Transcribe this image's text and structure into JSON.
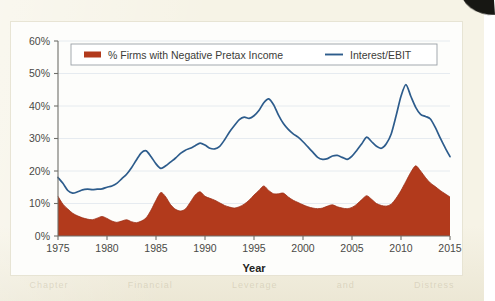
{
  "figure": {
    "type": "scanned-chart-figure",
    "background_color": "#f6f3e6",
    "card_color": "#fdfdfb"
  },
  "legend": {
    "position": "top-inside",
    "entries": [
      {
        "label": "% Firms with Negative Pretax Income",
        "marker": "filled-swatch",
        "color": "#b23a1c"
      },
      {
        "label": "Interest/EBIT",
        "marker": "line",
        "color": "#2d5c8c"
      }
    ]
  },
  "axes": {
    "x": {
      "title": "Year",
      "ticks": [
        "1975",
        "1980",
        "1985",
        "1990",
        "1995",
        "2000",
        "2005",
        "2010",
        "2015"
      ],
      "min": 1975,
      "max": 2015
    },
    "y": {
      "title": "",
      "ticks": [
        "0%",
        "10%",
        "20%",
        "30%",
        "40%",
        "50%",
        "60%"
      ],
      "min": 0,
      "max": 60,
      "unit": "%"
    }
  },
  "chart_data": {
    "type": "area",
    "title": "",
    "subtitle": "",
    "xlabel": "Year",
    "ylabel": "",
    "xlim": [
      1975,
      2015
    ],
    "ylim": [
      0,
      60
    ],
    "grid": true,
    "legend_position": "top-inside",
    "x_tick_labels": [
      "1975",
      "1980",
      "1985",
      "1990",
      "1995",
      "2000",
      "2005",
      "2010",
      "2015"
    ],
    "y_tick_labels": [
      "0%",
      "10%",
      "20%",
      "30%",
      "40%",
      "50%",
      "60%"
    ],
    "x": [
      1975.0,
      1975.5,
      1976.0,
      1976.5,
      1977.0,
      1977.5,
      1978.0,
      1978.5,
      1979.0,
      1979.5,
      1980.0,
      1980.5,
      1981.0,
      1981.5,
      1982.0,
      1982.5,
      1983.0,
      1983.5,
      1984.0,
      1984.5,
      1985.0,
      1985.5,
      1986.0,
      1986.5,
      1987.0,
      1987.5,
      1988.0,
      1988.5,
      1989.0,
      1989.5,
      1990.0,
      1990.5,
      1991.0,
      1991.5,
      1992.0,
      1992.5,
      1993.0,
      1993.5,
      1994.0,
      1994.5,
      1995.0,
      1995.5,
      1996.0,
      1996.5,
      1997.0,
      1997.5,
      1998.0,
      1998.5,
      1999.0,
      1999.5,
      2000.0,
      2000.5,
      2001.0,
      2001.5,
      2002.0,
      2002.5,
      2003.0,
      2003.5,
      2004.0,
      2004.5,
      2005.0,
      2005.5,
      2006.0,
      2006.5,
      2007.0,
      2007.5,
      2008.0,
      2008.5,
      2009.0,
      2009.5,
      2010.0,
      2010.5,
      2011.0,
      2011.5,
      2012.0,
      2012.5,
      2013.0,
      2013.5,
      2014.0,
      2014.5,
      2015.0
    ],
    "series": [
      {
        "name": "% Firms with Negative Pretax Income",
        "color": "#b23a1c",
        "style": "filled-area",
        "values": [
          12.2,
          9.8,
          8.3,
          7.0,
          6.2,
          5.6,
          5.2,
          5.0,
          5.5,
          6.0,
          5.4,
          4.6,
          4.2,
          4.6,
          5.0,
          4.4,
          4.1,
          4.6,
          5.6,
          8.0,
          11.0,
          13.4,
          12.0,
          9.6,
          8.2,
          7.7,
          8.3,
          10.4,
          12.6,
          13.6,
          12.2,
          11.6,
          11.0,
          10.2,
          9.4,
          8.9,
          8.6,
          9.0,
          9.8,
          11.0,
          12.6,
          14.0,
          15.4,
          14.0,
          13.0,
          13.0,
          13.2,
          12.0,
          11.0,
          10.3,
          9.6,
          9.0,
          8.6,
          8.4,
          8.6,
          9.2,
          9.6,
          9.0,
          8.6,
          8.4,
          8.8,
          9.8,
          11.2,
          12.4,
          11.3,
          10.0,
          9.4,
          9.2,
          9.8,
          11.6,
          14.0,
          16.8,
          19.6,
          21.6,
          20.0,
          18.0,
          16.3,
          15.2,
          14.0,
          13.0,
          12.0
        ],
        "note_indexed_years": {
          "1975": 12.2,
          "1983": 4.1,
          "1986_peak": 13.4,
          "1991_peak": 13.6,
          "1996_peak": 15.4,
          "2002_peak": 21.6,
          "2009_peak": 20.6,
          "2015": 5.5
        }
      },
      {
        "name": "Interest/EBIT",
        "color": "#2d5c8c",
        "style": "line",
        "values": [
          18.0,
          16.2,
          14.0,
          13.2,
          13.6,
          14.2,
          14.4,
          14.3,
          14.4,
          14.5,
          15.0,
          15.4,
          16.2,
          17.6,
          19.0,
          21.0,
          23.4,
          25.6,
          26.2,
          24.4,
          22.2,
          20.8,
          21.6,
          22.8,
          24.0,
          25.4,
          26.4,
          27.0,
          27.8,
          28.6,
          28.0,
          27.0,
          26.8,
          27.6,
          29.6,
          32.0,
          34.0,
          35.8,
          36.6,
          36.2,
          37.0,
          38.6,
          41.0,
          42.2,
          40.4,
          37.2,
          34.6,
          32.8,
          31.4,
          30.4,
          29.0,
          27.4,
          25.8,
          24.2,
          23.6,
          23.8,
          24.6,
          24.8,
          24.2,
          23.6,
          24.6,
          26.4,
          28.4,
          30.4,
          29.0,
          27.6,
          27.0,
          28.4,
          31.4,
          37.0,
          43.0,
          46.6,
          43.0,
          39.6,
          37.4,
          36.8,
          36.0,
          33.4,
          30.2,
          27.2,
          24.4
        ],
        "note_indexed_years": {
          "1975": 18.0,
          "1977_trough": 13.0,
          "1983_peak": 26.2,
          "1985_trough": 20.6,
          "1991_peak": 42.2,
          "1996_trough": 23.4,
          "1999_peak": 30.4,
          "2002_peak": 46.8,
          "2004_trough": 21.0,
          "2009_peak": 53.8,
          "2015": 11.5
        }
      }
    ]
  },
  "colors": {
    "red_series": "#b23a1c",
    "blue_series": "#2d5c8c",
    "grid": "#dfe6ee",
    "axis": "#6f6f6a",
    "text": "#4a4a46",
    "page_bg": "#f6f3e6"
  },
  "artifacts": {
    "bleed_text": [
      "Chapter",
      "Financial",
      "Leverage",
      "and",
      "Distress"
    ],
    "corner_mark": "dark-scan-corner"
  }
}
